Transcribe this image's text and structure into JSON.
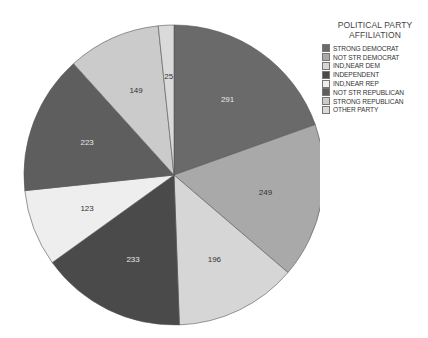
{
  "chart_data": {
    "type": "pie",
    "title": "",
    "legend_title": "POLITICAL PARTY AFFILIATION",
    "legend_position": "right",
    "start_angle_deg": 0,
    "direction": "clockwise",
    "categories": [
      "STRONG DEMOCRAT",
      "NOT STR DEMOCRAT",
      "IND,NEAR DEM",
      "INDEPENDENT",
      "IND,NEAR REP",
      "NOT STR REPUBLICAN",
      "STRONG REPUBLICAN",
      "OTHER PARTY"
    ],
    "values": [
      291,
      249,
      196,
      233,
      123,
      223,
      149,
      25
    ],
    "colors": [
      "#6a6a6a",
      "#a9a9a9",
      "#d6d6d6",
      "#4a4a4a",
      "#eeeeee",
      "#5e5e5e",
      "#cbcbcb",
      "#dadada"
    ],
    "label_colors": [
      "light",
      "dark",
      "dark",
      "light",
      "dark",
      "light",
      "dark",
      "dark"
    ]
  },
  "legend": {
    "title_line1": "POLITICAL PARTY",
    "title_line2": "AFFILIATION",
    "items": [
      {
        "label": "STRONG DEMOCRAT"
      },
      {
        "label": "NOT STR DEMOCRAT"
      },
      {
        "label": "IND,NEAR DEM"
      },
      {
        "label": "INDEPENDENT"
      },
      {
        "label": "IND,NEAR REP"
      },
      {
        "label": "NOT STR REPUBLICAN"
      },
      {
        "label": "STRONG REPUBLICAN"
      },
      {
        "label": "OTHER PARTY"
      }
    ]
  }
}
